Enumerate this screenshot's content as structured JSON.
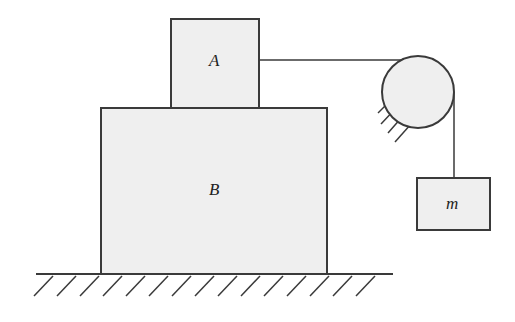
{
  "diagram": {
    "type": "physics-pulley-blocks",
    "colors": {
      "stroke": "#3a3a3a",
      "fill": "#efefef",
      "background": "#ffffff"
    },
    "labels": {
      "block_a": "A",
      "block_b": "B",
      "hanging_mass": "m"
    },
    "elements": [
      {
        "id": "block-B",
        "label": "B",
        "description": "large block resting on ground"
      },
      {
        "id": "block-A",
        "label": "A",
        "description": "small block resting on top of B"
      },
      {
        "id": "pulley",
        "description": "fixed pulley attached to wall mount"
      },
      {
        "id": "string",
        "description": "string from A over pulley to hanging mass"
      },
      {
        "id": "hanging-mass",
        "label": "m",
        "description": "hanging block"
      },
      {
        "id": "ground",
        "description": "hatched fixed surface"
      }
    ]
  }
}
